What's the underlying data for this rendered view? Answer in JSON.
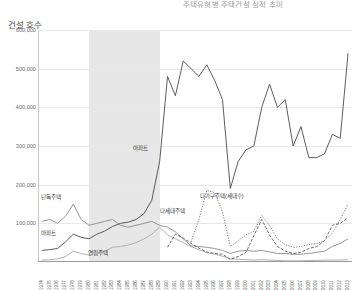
{
  "chart": {
    "title": "주택유형별 주택건설 실적 추이",
    "y_axis_title": "건설 호수"
  },
  "series_labels": {
    "apartment_top": "아파트",
    "detached": "단독주택",
    "apartment_left": "아파트",
    "rowhouse": "연립주택",
    "multifamily": "다가구주택(세대수)",
    "multihousehold": "다세대주택"
  },
  "chart_data": {
    "type": "line",
    "title": "주택유형별 주택건설 실적 추이",
    "xlabel": "",
    "ylabel": "건설 호수",
    "ylim": [
      0,
      600000
    ],
    "yticks": [
      100000,
      200000,
      300000,
      400000,
      500000,
      600000
    ],
    "ytick_labels": [
      "100,000",
      "200,000",
      "300,000",
      "400,000",
      "500,000",
      "600,000"
    ],
    "grid": true,
    "legend": "inline-annotations",
    "shaded_band": {
      "from": 1980,
      "to": 1989,
      "color": "#e3e3e3"
    },
    "categories": [
      1974,
      1975,
      1976,
      1977,
      1978,
      1979,
      1980,
      1981,
      1982,
      1983,
      1984,
      1985,
      1986,
      1987,
      1988,
      1989,
      1990,
      1991,
      1992,
      1993,
      1994,
      1995,
      1996,
      1997,
      1998,
      1999,
      2000,
      2001,
      2002,
      2003,
      2004,
      2005,
      2006,
      2007,
      2008,
      2009,
      2010,
      2011,
      2012,
      2013
    ],
    "series": [
      {
        "name": "아파트",
        "color": "#4a4a4a",
        "style": "solid",
        "values": [
          30000,
          32000,
          35000,
          52000,
          72000,
          64000,
          60000,
          72000,
          80000,
          92000,
          100000,
          103000,
          110000,
          125000,
          160000,
          260000,
          480000,
          430000,
          520000,
          500000,
          480000,
          510000,
          470000,
          420000,
          190000,
          260000,
          290000,
          300000,
          400000,
          460000,
          400000,
          420000,
          300000,
          350000,
          270000,
          270000,
          280000,
          330000,
          320000,
          540000
        ]
      },
      {
        "name": "단독주택",
        "color": "#8a8a8a",
        "style": "solid",
        "values": [
          105000,
          110000,
          100000,
          118000,
          150000,
          110000,
          95000,
          100000,
          105000,
          110000,
          95000,
          90000,
          95000,
          100000,
          105000,
          95000,
          90000,
          78000,
          60000,
          42000,
          40000,
          38000,
          35000,
          30000,
          22000,
          28000,
          30000,
          28000,
          30000,
          26000,
          22000,
          22000,
          20000,
          20000,
          22000,
          25000,
          28000,
          40000,
          48000,
          60000
        ]
      },
      {
        "name": "연립주택",
        "color": "#a8a8a8",
        "style": "solid",
        "values": [
          5000,
          6000,
          8000,
          14000,
          28000,
          22000,
          18000,
          22000,
          28000,
          38000,
          40000,
          44000,
          50000,
          60000,
          72000,
          90000,
          70000,
          60000,
          50000,
          40000,
          32000,
          24000,
          20000,
          15000,
          8000,
          7000,
          6000,
          5000,
          6000,
          5000,
          4000,
          3000,
          3000,
          3000,
          4000,
          4000,
          5000,
          5000,
          5000,
          6000
        ]
      },
      {
        "name": "다세대주택",
        "color": "#5a5a5a",
        "style": "dashed",
        "values": [
          0,
          0,
          0,
          0,
          0,
          0,
          0,
          0,
          0,
          0,
          0,
          0,
          0,
          0,
          0,
          0,
          38000,
          72000,
          62000,
          48000,
          36000,
          26000,
          22000,
          20000,
          7000,
          14000,
          25000,
          68000,
          110000,
          70000,
          40000,
          28000,
          22000,
          25000,
          35000,
          40000,
          55000,
          95000,
          100000,
          115000
        ]
      },
      {
        "name": "다가구주택(세대수)",
        "color": "#707070",
        "style": "dotted",
        "values": [
          0,
          0,
          0,
          0,
          0,
          0,
          0,
          0,
          0,
          0,
          0,
          0,
          0,
          0,
          0,
          0,
          0,
          0,
          0,
          52000,
          110000,
          185000,
          180000,
          130000,
          40000,
          55000,
          70000,
          80000,
          120000,
          95000,
          60000,
          45000,
          38000,
          40000,
          45000,
          48000,
          55000,
          75000,
          110000,
          150000
        ]
      }
    ]
  }
}
